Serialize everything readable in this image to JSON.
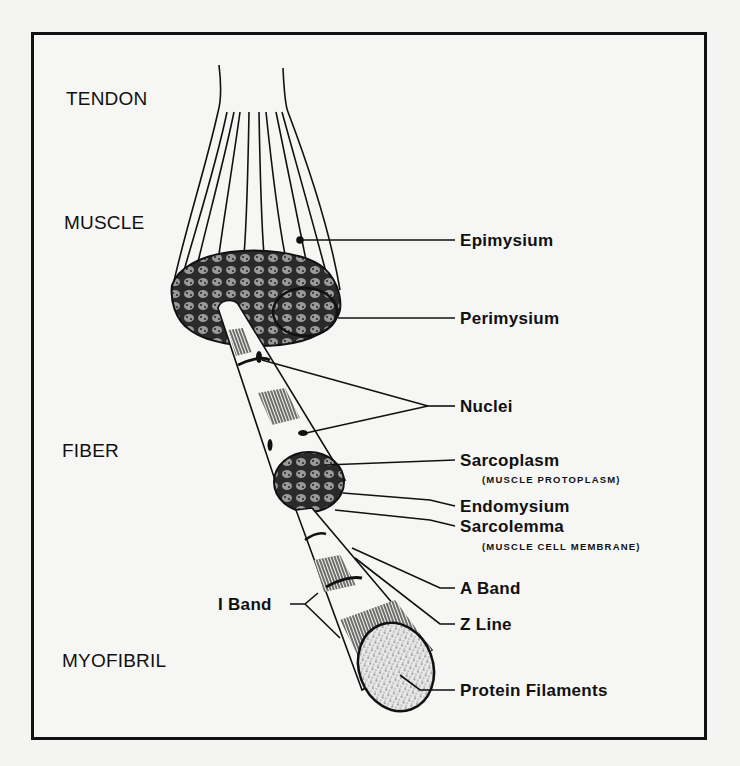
{
  "figure": {
    "type": "anatomical-diagram",
    "levels": [
      {
        "id": "tendon",
        "label": "TENDON"
      },
      {
        "id": "muscle",
        "label": "MUSCLE"
      },
      {
        "id": "fiber",
        "label": "FIBER"
      },
      {
        "id": "myofibril",
        "label": "MYOFIBRIL"
      }
    ],
    "callouts": [
      {
        "id": "epimysium",
        "label": "Epimysium"
      },
      {
        "id": "perimysium",
        "label": "Perimysium"
      },
      {
        "id": "nuclei",
        "label": "Nuclei"
      },
      {
        "id": "sarcoplasm",
        "label": "Sarcoplasm",
        "note": "(MUSCLE PROTOPLASM)"
      },
      {
        "id": "endomysium",
        "label": "Endomysium"
      },
      {
        "id": "sarcolemma",
        "label": "Sarcolemma",
        "note": "(MUSCLE CELL MEMBRANE)"
      },
      {
        "id": "a_band",
        "label": "A Band"
      },
      {
        "id": "z_line",
        "label": "Z Line"
      },
      {
        "id": "i_band",
        "label": "I Band"
      },
      {
        "id": "protein_filaments",
        "label": "Protein Filaments"
      }
    ]
  },
  "colors": {
    "ink": "#111111",
    "paper": "#f6f6f4"
  }
}
